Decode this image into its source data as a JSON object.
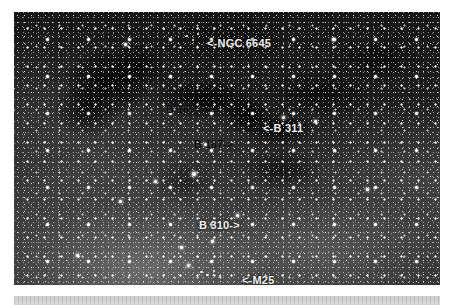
{
  "page": {
    "background_color": "#ffffff"
  },
  "photo": {
    "alt": "Wide-field black and white photograph of a dense Milky Way star cloud in Sagittarius with dark nebulae",
    "background_color": "#1a1a1a",
    "border_color": "#000000"
  },
  "annotations": [
    {
      "id": "ngc6645",
      "text": "<-NGC 6645",
      "object": "NGC 6645",
      "arrow": "left",
      "color": "#f2f2f2",
      "style": "white"
    },
    {
      "id": "b167",
      "text": "B 167->",
      "object": "B 167",
      "arrow": "right",
      "color": "#0b0b0b",
      "style": "black"
    },
    {
      "id": "b311",
      "text": "<-B 311",
      "object": "B 311",
      "arrow": "left",
      "color": "#f2f2f2",
      "style": "white"
    },
    {
      "id": "b187",
      "text": "B 187->",
      "object": "B 187",
      "arrow": "right",
      "color": "#0b0b0b",
      "style": "black"
    },
    {
      "id": "b310",
      "text": "B 310->",
      "object": "B 310",
      "arrow": "right",
      "color": "#f2f2f2",
      "style": "white"
    },
    {
      "id": "m25",
      "text": "<-M25",
      "object": "M25",
      "arrow": "left",
      "color": "#f2f2f2",
      "style": "white"
    }
  ],
  "bottom_bar": {
    "color": "#d2d2d2",
    "text": ""
  }
}
